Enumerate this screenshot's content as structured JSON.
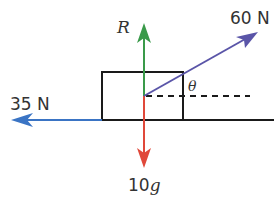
{
  "diagram": {
    "colors": {
      "outline": "#1a1a1a",
      "reaction": "#3a9a4a",
      "weight": "#e0483a",
      "friction": "#3a74c4",
      "pull": "#5a55a8",
      "dashed": "#1a1a1a",
      "text": "#333333"
    },
    "forces": {
      "reaction": {
        "label": "R",
        "direction": "up"
      },
      "weight": {
        "label_number": "10",
        "label_symbol": "g",
        "direction": "down"
      },
      "friction": {
        "label": "35 N",
        "direction": "left"
      },
      "pull": {
        "label": "60 N",
        "direction": "up-right at angle θ"
      }
    },
    "angle": {
      "label": "θ"
    },
    "block": {
      "shape": "rectangle"
    },
    "surface": {
      "shape": "horizontal line"
    },
    "reference_line": {
      "style": "dashed",
      "direction": "horizontal"
    }
  }
}
